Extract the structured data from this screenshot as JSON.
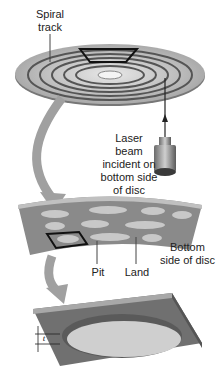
{
  "diagram": {
    "labels": {
      "spiral_track": [
        "Spiral",
        "track"
      ],
      "laser_beam": [
        "Laser beam",
        "incident on",
        "bottom side",
        "of disc"
      ],
      "bottom_side": [
        "Bottom",
        "side of disc"
      ],
      "pit": "Pit",
      "land": "Land",
      "thickness": "t"
    },
    "colors": {
      "disc": "#b8b8b8",
      "track": "#555555",
      "arrow": "#9a9a9a",
      "surface": "#8a8a8a",
      "pit": "#c8c8c8",
      "highlight": "#111111"
    }
  }
}
